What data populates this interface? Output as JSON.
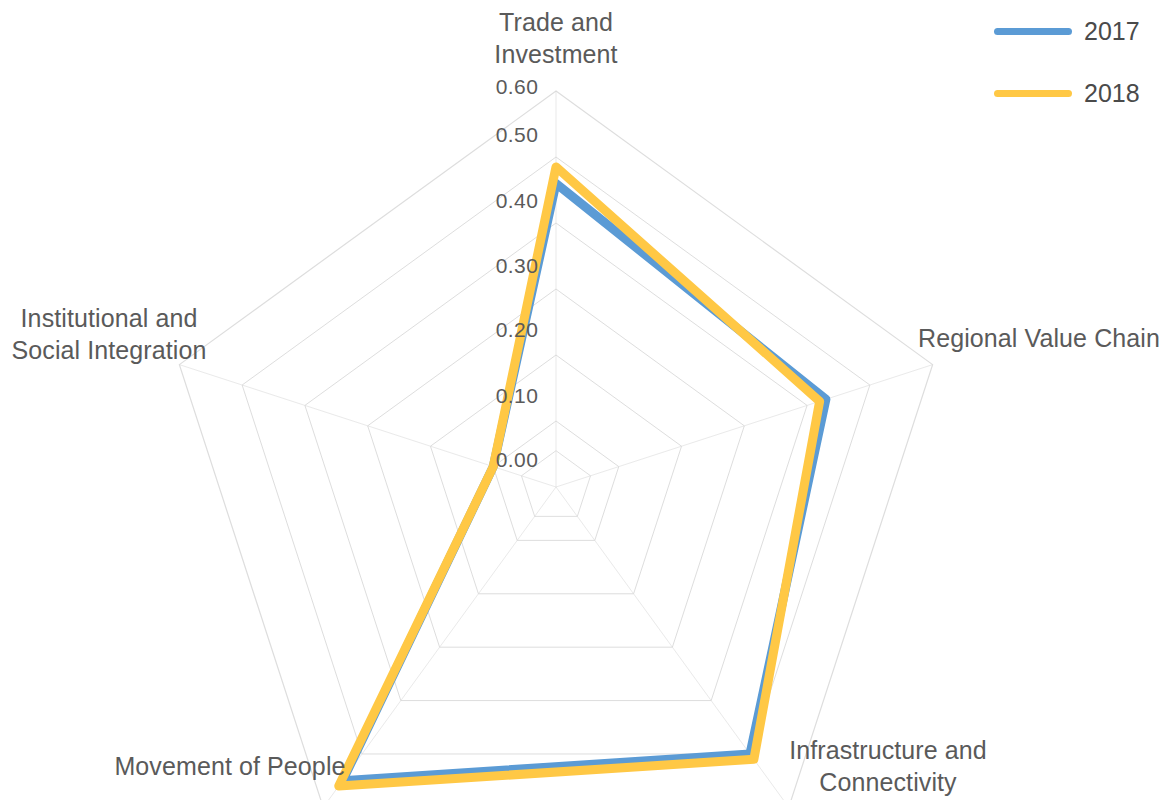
{
  "chart_data": {
    "type": "radar",
    "title": "",
    "categories": [
      "Trade and\nInvestment",
      "Regional Value Chain",
      "Infrastructure and\nConnectivity",
      "Movement of People",
      "Institutional and\nSocial Integration"
    ],
    "series": [
      {
        "name": "2017",
        "color": "#5B9BD5",
        "values": [
          0.46,
          0.43,
          0.5,
          0.55,
          0.1
        ]
      },
      {
        "name": "2018",
        "color": "#FFC845",
        "values": [
          0.485,
          0.42,
          0.51,
          0.56,
          0.1
        ]
      }
    ],
    "tick_labels": [
      "0.00",
      "0.10",
      "0.20",
      "0.30",
      "0.40",
      "0.50",
      "0.60"
    ],
    "tick_values": [
      0.0,
      0.1,
      0.2,
      0.3,
      0.4,
      0.5,
      0.6
    ],
    "rlim": [
      0.0,
      0.6
    ],
    "grid": true,
    "grid_color": "#D9D9D9",
    "legend_position": "top-right",
    "axis_label_color": "#5A5A5A"
  },
  "legend": {
    "entries": [
      {
        "label": "2017",
        "color": "#5B9BD5"
      },
      {
        "label": "2018",
        "color": "#FFC845"
      }
    ]
  },
  "labels": {
    "trade_and_investment": "Trade and\nInvestment",
    "regional_value_chain": "Regional Value Chain",
    "infrastructure_and_connectivity": "Infrastructure and\nConnectivity",
    "movement_of_people": "Movement of People",
    "institutional_and_social_integration": "Institutional and\nSocial Integration"
  },
  "ticks": {
    "t0": "0.00",
    "t1": "0.10",
    "t2": "0.20",
    "t3": "0.30",
    "t4": "0.40",
    "t5": "0.50",
    "t6": "0.60"
  }
}
